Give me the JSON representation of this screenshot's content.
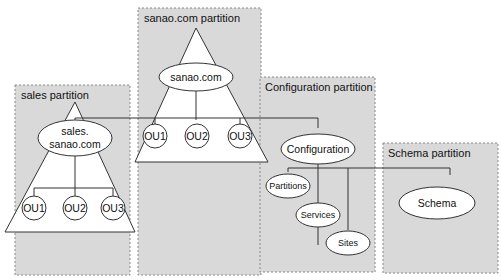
{
  "partitions": {
    "sales": {
      "label": "sales partition"
    },
    "sanao": {
      "label": "sanao.com partition"
    },
    "config": {
      "label": "Configuration partition"
    },
    "schema": {
      "label": "Schema partition"
    }
  },
  "nodes": {
    "sales_line1": "sales.",
    "sales_line2": "sanao.com",
    "sanao": "sanao.com",
    "configuration": "Configuration",
    "schema": "Schema",
    "partitions": "Partitions",
    "services": "Services",
    "sites": "Sites",
    "sales_ous": [
      "OU1",
      "OU2",
      "OU3"
    ],
    "sanao_ous": [
      "OU1",
      "OU2",
      "OU3"
    ]
  },
  "colors": {
    "partition_fill": "#d9d9d9",
    "partition_border": "#888888",
    "shape_fill": "#ffffff",
    "line": "#333333"
  }
}
